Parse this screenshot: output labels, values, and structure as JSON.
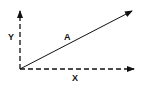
{
  "diagram": {
    "type": "vector-components",
    "labels": {
      "vector": "A",
      "x_component": "X",
      "y_component": "Y"
    },
    "origin": [
      20,
      69
    ],
    "vector_tip": [
      132,
      10
    ],
    "x_axis_tip": [
      134,
      69
    ],
    "y_axis_tip": [
      20,
      10
    ],
    "color": "#111111"
  }
}
